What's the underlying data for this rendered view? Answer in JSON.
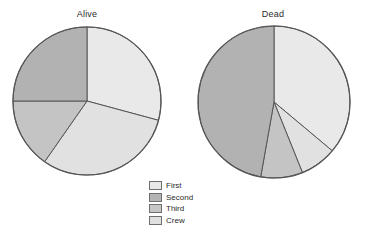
{
  "figure": {
    "background": "#ffffff"
  },
  "chart_data": {
    "type": "pie",
    "title": "",
    "subtitle": "",
    "charts": [
      {
        "title": "Alive",
        "categories": [
          "First",
          "Second",
          "Third",
          "Crew"
        ],
        "values": [
          29.2,
          25.0,
          15.3,
          30.5
        ],
        "slice_order_clockwise_from_12": [
          "First",
          "Crew",
          "Third",
          "Second"
        ],
        "start_angle_deg": 0,
        "direction": "clockwise",
        "center": [
          87,
          101
        ],
        "radius": 74
      },
      {
        "title": "Dead",
        "categories": [
          "First",
          "Second",
          "Third",
          "Crew"
        ],
        "values": [
          36.1,
          47.2,
          8.9,
          7.8
        ],
        "slice_order_clockwise_from_12": [
          "First",
          "Crew",
          "Third",
          "Second"
        ],
        "start_angle_deg": 0,
        "direction": "clockwise",
        "center": [
          274,
          102
        ],
        "radius": 76
      }
    ],
    "legend": {
      "position": "bottom-center",
      "entries": [
        {
          "label": "First",
          "color": "#e8e8e8"
        },
        {
          "label": "Second",
          "color": "#b4b4b4"
        },
        {
          "label": "Third",
          "color": "#c6c6c6"
        },
        {
          "label": "Crew",
          "color": "#e0e0e0"
        }
      ]
    },
    "grid": false,
    "xlabel": "",
    "ylabel": ""
  },
  "colors": {
    "first": "#e9e9e9",
    "second": "#b2b2b2",
    "third": "#c4c4c4",
    "crew": "#e1e1e1",
    "outline": "#565656",
    "text": "#2b2b2b"
  },
  "titles": {
    "alive": "Alive",
    "dead": "Dead"
  },
  "legend": {
    "items": [
      {
        "label": "First"
      },
      {
        "label": "Second"
      },
      {
        "label": "Third"
      },
      {
        "label": "Crew"
      }
    ]
  }
}
